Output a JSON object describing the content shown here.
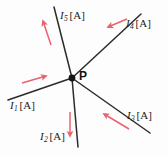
{
  "figure": {
    "kind": "circuit-junction-diagram",
    "background_color": "#fdfdfd",
    "width": 168,
    "height": 155,
    "wire_color": "#2b2b2b",
    "arrow_color": "#e8636b",
    "node": {
      "label": "P",
      "x": 72,
      "y": 78,
      "dot_color": "#141414",
      "dot_radius": 3.4,
      "label_x": 79,
      "label_y": 70
    },
    "unit": "[A]",
    "branches": [
      {
        "id": "branch-1",
        "symbol": "I",
        "subscript": "1",
        "unit": "[A]",
        "label_text": "I",
        "direction": "into-junction",
        "end_x": 8,
        "end_y": 100,
        "label_x": 10,
        "label_y": 100,
        "arrow_x1": 22,
        "arrow_y1": 83,
        "arrow_x2": 46,
        "arrow_y2": 76
      },
      {
        "id": "branch-2",
        "symbol": "I",
        "subscript": "2",
        "unit": "[A]",
        "label_text": "I",
        "direction": "out-of-junction",
        "end_x": 78,
        "end_y": 147,
        "label_x": 40,
        "label_y": 131,
        "arrow_x1": 70,
        "arrow_y1": 112,
        "arrow_x2": 70,
        "arrow_y2": 136
      },
      {
        "id": "branch-3",
        "symbol": "I",
        "subscript": "3",
        "unit": "[A]",
        "label_text": "I",
        "direction": "into-junction",
        "end_x": 150,
        "end_y": 133,
        "label_x": 127,
        "label_y": 110,
        "arrow_x1": 129,
        "arrow_y1": 129,
        "arrow_x2": 104,
        "arrow_y2": 114
      },
      {
        "id": "branch-4",
        "symbol": "I",
        "subscript": "4",
        "unit": "[A]",
        "label_text": "I",
        "direction": "into-junction",
        "end_x": 141,
        "end_y": 14,
        "label_x": 126,
        "label_y": 18,
        "arrow_x1": 127,
        "arrow_y1": 19,
        "arrow_x2": 108,
        "arrow_y2": 27
      },
      {
        "id": "branch-5",
        "symbol": "I",
        "subscript": "5",
        "unit": "[A]",
        "label_text": "I",
        "direction": "out-of-junction",
        "end_x": 54,
        "end_y": 7,
        "label_x": 60,
        "label_y": 10,
        "arrow_x1": 51,
        "arrow_y1": 45,
        "arrow_x2": 43,
        "arrow_y2": 21
      }
    ]
  }
}
